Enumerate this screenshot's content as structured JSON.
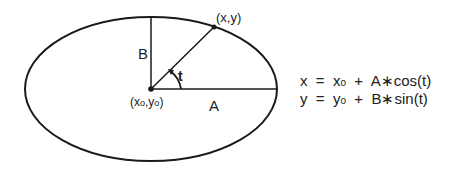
{
  "diagram": {
    "center_label": "(x0,y0)",
    "point_label": "(x,y)",
    "semi_major_label": "A",
    "semi_minor_label": "B",
    "angle_label": "t",
    "equations": [
      {
        "lhs": "x",
        "eq": "=",
        "base": "x",
        "sub": "o",
        "rest": "+  A∗cos(t)"
      },
      {
        "lhs": "y",
        "eq": "=",
        "base": "y",
        "sub": "o",
        "rest": "+  B∗sin(t)"
      }
    ],
    "colors": {
      "stroke": "#1a1a1a",
      "background": "#ffffff"
    }
  }
}
